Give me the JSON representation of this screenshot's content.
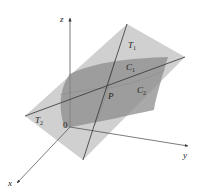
{
  "figure": {
    "title": "",
    "colors": {
      "background": "#ffffff",
      "tangent_plane": "#c4c4c4",
      "surface": "#8f8f8f",
      "lines": "#333333",
      "axes": "#444444",
      "text": "#222222"
    },
    "axes": {
      "z": {
        "label": "z"
      },
      "x": {
        "label": "x"
      },
      "y": {
        "label": "y"
      },
      "origin": {
        "label": "0"
      }
    },
    "tangent_lines": {
      "t1": {
        "label": "T",
        "sub": "1"
      },
      "t2": {
        "label": "T",
        "sub": "2"
      }
    },
    "curves": {
      "c1": {
        "label": "C",
        "sub": "1"
      },
      "c2": {
        "label": "C",
        "sub": "2"
      }
    },
    "point": {
      "label": "P"
    }
  }
}
